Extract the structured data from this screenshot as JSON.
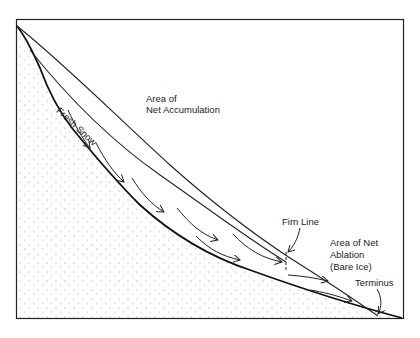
{
  "diagram": {
    "type": "glacier-cross-section",
    "labels": {
      "fresh_snow": "Fresh Snow",
      "accumulation_line1": "Area of",
      "accumulation_line2": "Net Accumulation",
      "firn_line": "Firn Line",
      "ablation_line1": "Area of Net",
      "ablation_line2": "Ablation",
      "ablation_line3": "(Bare Ice)",
      "terminus": "Terminus"
    },
    "colors": {
      "line": "#1a1a1a",
      "background": "#ffffff",
      "stipple": "#888888"
    }
  }
}
